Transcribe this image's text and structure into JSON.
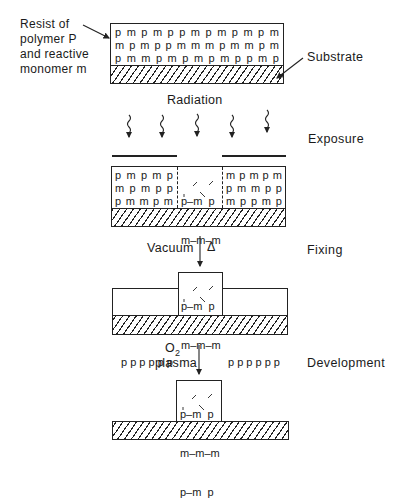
{
  "callouts": {
    "resist_label": [
      "Resist of",
      "polymer P",
      "and reactive",
      "monomer m"
    ],
    "substrate_label": "Substrate"
  },
  "stages": {
    "exposure": "Exposure",
    "fixing": "Fixing",
    "development": "Development"
  },
  "steps": {
    "radiation": "Radiation",
    "vacuum": "Vacuum",
    "heat_symbol": "Δ",
    "o2": "O",
    "o2_sub": "2",
    "plasma": "plasma"
  },
  "initial_resist": {
    "rows": [
      [
        "p",
        "m",
        "p",
        "m",
        "p",
        "p",
        "m",
        "p",
        "m",
        "p",
        "m",
        "p",
        "m"
      ],
      [
        "m",
        "p",
        "m",
        "p",
        "p",
        "m",
        "m",
        "m",
        "p",
        "m",
        "m",
        "p",
        "m"
      ],
      [
        "p",
        "m",
        "m",
        "p",
        "m",
        "p",
        "m",
        "p",
        "m",
        "p",
        "p",
        "m",
        "p"
      ]
    ]
  },
  "exposed_resist": {
    "left_rows": [
      [
        "p",
        "m",
        "p",
        "m",
        "p"
      ],
      [
        "m",
        "p",
        "m",
        "p",
        "p"
      ],
      [
        "p",
        "m",
        "m",
        "p",
        "m"
      ]
    ],
    "center_rows": [
      "p–m  p",
      "m–m–m",
      "p–m  p"
    ],
    "right_rows": [
      [
        "m",
        "p",
        "m",
        "p",
        "m"
      ],
      [
        "p",
        "m",
        "m",
        "p",
        "p"
      ],
      [
        "m",
        "p",
        "p",
        "m",
        "p"
      ]
    ]
  },
  "fixed_resist": {
    "left_p": "p p p p p p",
    "center_rows": [
      "p–m  p",
      "m–m–m",
      "p–m  p"
    ],
    "right_p": "p p p p p p"
  },
  "developed_resist": {
    "center_rows": [
      "p–m  p",
      "m–m–m",
      "p–m  p"
    ]
  }
}
